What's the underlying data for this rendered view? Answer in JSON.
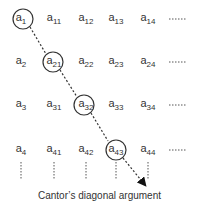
{
  "diagram": {
    "caption": "Cantor’s diagonal argument",
    "rows": [
      {
        "cells": [
          {
            "base": "a",
            "sub": "1",
            "circled": true
          },
          {
            "base": "a",
            "sub": "11"
          },
          {
            "base": "a",
            "sub": "12"
          },
          {
            "base": "a",
            "sub": "13"
          },
          {
            "base": "a",
            "sub": "14"
          }
        ],
        "ellipsis": "......."
      },
      {
        "cells": [
          {
            "base": "a",
            "sub": "2"
          },
          {
            "base": "a",
            "sub": "21",
            "circled": true
          },
          {
            "base": "a",
            "sub": "22"
          },
          {
            "base": "a",
            "sub": "23"
          },
          {
            "base": "a",
            "sub": "24"
          }
        ],
        "ellipsis": "......."
      },
      {
        "cells": [
          {
            "base": "a",
            "sub": "3"
          },
          {
            "base": "a",
            "sub": "31"
          },
          {
            "base": "a",
            "sub": "32",
            "circled": true
          },
          {
            "base": "a",
            "sub": "33"
          },
          {
            "base": "a",
            "sub": "34"
          }
        ],
        "ellipsis": "......."
      },
      {
        "cells": [
          {
            "base": "a",
            "sub": "4"
          },
          {
            "base": "a",
            "sub": "41"
          },
          {
            "base": "a",
            "sub": "42"
          },
          {
            "base": "a",
            "sub": "43",
            "circled": true
          },
          {
            "base": "a",
            "sub": "44"
          }
        ],
        "ellipsis": "......."
      }
    ]
  }
}
